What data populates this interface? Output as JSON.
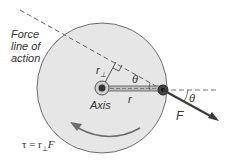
{
  "diagram": {
    "labels": {
      "force_line": [
        "Force",
        "line of",
        "action"
      ],
      "axis": "Axis",
      "r_perp": "r",
      "r_perp_sub": "⊥",
      "theta_1": "θ",
      "theta_2": "θ",
      "r": "r",
      "F": "F",
      "equation_prefix": "τ = r",
      "equation_sub": "⊥",
      "equation_suffix": "F"
    },
    "colors": {
      "disk_fill": "#e6e6e6",
      "disk_stroke": "#6d6d6d",
      "force_arrow": "#3a3a3a",
      "dashed_line": "#666666",
      "text": "#333333"
    }
  }
}
